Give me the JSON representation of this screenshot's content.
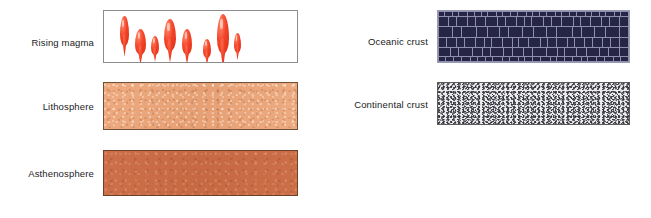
{
  "figure": {
    "type": "geology-legend-key",
    "background": "#ffffff"
  },
  "entries": [
    {
      "id": "rising-magma",
      "label": "Rising magma",
      "texture": "red-teardrop-droplets-on-white",
      "swatch_fill": "#ffffff",
      "border_color": "#8c8c8c",
      "accent_color": "#ee3b22",
      "column": "left",
      "droplets": [
        {
          "left": 16,
          "top": 5,
          "width": 9,
          "height": 30
        },
        {
          "left": 31,
          "top": 18,
          "width": 11,
          "height": 26
        },
        {
          "left": 47,
          "top": 25,
          "width": 8,
          "height": 19
        },
        {
          "left": 60,
          "top": 8,
          "width": 12,
          "height": 32
        },
        {
          "left": 78,
          "top": 18,
          "width": 10,
          "height": 26
        },
        {
          "left": 99,
          "top": 28,
          "width": 8,
          "height": 19
        },
        {
          "left": 113,
          "top": 3,
          "width": 12,
          "height": 40
        },
        {
          "left": 130,
          "top": 22,
          "width": 7,
          "height": 20
        }
      ]
    },
    {
      "id": "lithosphere",
      "label": "Lithosphere",
      "texture": "peach-mottled-solid",
      "swatch_fill": "#e8a276",
      "border_color": "#6d5238",
      "column": "left"
    },
    {
      "id": "asthenosphere",
      "label": "Asthenosphere",
      "texture": "terracotta-mottled-solid",
      "swatch_fill": "#c96c46",
      "border_color": "#6d4028",
      "column": "left"
    },
    {
      "id": "oceanic-crust",
      "label": "Oceanic crust",
      "texture": "dark-navy-brick-blocks",
      "swatch_fill": "#262545",
      "border_color": "#9a9ab2",
      "mortar_color": "#8e8fad",
      "column": "right",
      "brick_rows": [
        {
          "count": 26,
          "size": "thin"
        },
        {
          "count": 20,
          "size": "normal"
        },
        {
          "count": 16,
          "size": "tall"
        },
        {
          "count": 21,
          "size": "normal"
        },
        {
          "count": 18,
          "size": "normal"
        },
        {
          "count": 24,
          "size": "thin"
        }
      ]
    },
    {
      "id": "continental-crust",
      "label": "Continental crust",
      "texture": "gray-white-speckled-granite",
      "swatch_fill": "#ececed",
      "border_color": "#5c5c5c",
      "speckle_color": "#3d3d46",
      "column": "right"
    }
  ]
}
